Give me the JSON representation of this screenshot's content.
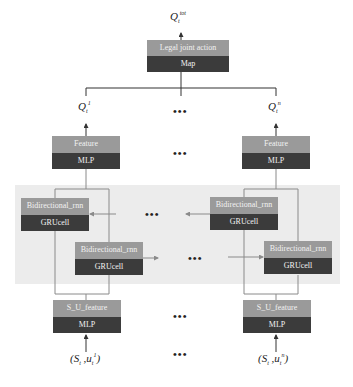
{
  "top": {
    "output_label": {
      "base": "Q",
      "sup": "tot",
      "sub": "t"
    },
    "box": {
      "top": "Legal joint action",
      "bottom": "Map"
    }
  },
  "agents": [
    {
      "q_label": {
        "base": "Q",
        "sup": "1",
        "sub": "t"
      },
      "feature_box": {
        "top": "Feature",
        "bottom": "MLP"
      },
      "rnn_boxes": [
        {
          "top": "Bidirectional_rnn",
          "bottom": "GRUcell"
        },
        {
          "top": "Bidirectional_rnn",
          "bottom": "GRUcell"
        }
      ],
      "input_box": {
        "top": "S_U_feature",
        "bottom": "MLP"
      },
      "input_label": {
        "open": "(S",
        "s_sub": "t",
        "mid": " ,u",
        "sup": "1",
        "sub": "t",
        "close": ")"
      }
    },
    {
      "q_label": {
        "base": "Q",
        "sup": "n",
        "sub": "t"
      },
      "feature_box": {
        "top": "Feature",
        "bottom": "MLP"
      },
      "rnn_boxes": [
        {
          "top": "Bidirectional_rnn",
          "bottom": "GRUcell"
        },
        {
          "top": "Bidirectional_rnn",
          "bottom": "GRUcell"
        }
      ],
      "input_box": {
        "top": "S_U_feature",
        "bottom": "MLP"
      },
      "input_label": {
        "open": "(S",
        "s_sub": "t",
        "mid": " ,u",
        "sup": "n",
        "sub": "t",
        "close": ")"
      }
    }
  ],
  "ellipsis": "•••",
  "colors": {
    "box_top": "#9a9a9a",
    "box_bottom": "#3b3b3b",
    "panel": "#ececec",
    "line": "#333333",
    "inner_line": "#8a8a8a"
  }
}
